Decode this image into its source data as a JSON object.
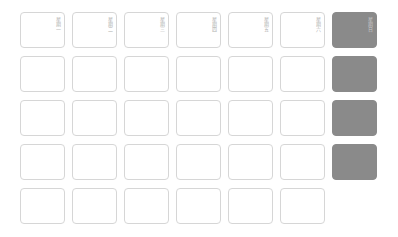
{
  "calendar": {
    "weekday_headers": [
      "星期一",
      "星期二",
      "星期三",
      "星期四",
      "星期五",
      "星期六",
      "星期日"
    ],
    "rows": 5,
    "columns": 7,
    "shaded_color": "#8a8a8a",
    "border_color": "#d6d6d6",
    "shaded_cells": [
      [
        0,
        6
      ],
      [
        1,
        6
      ],
      [
        2,
        6
      ],
      [
        3,
        6
      ]
    ],
    "empty_cells": [
      [
        4,
        6
      ]
    ]
  }
}
